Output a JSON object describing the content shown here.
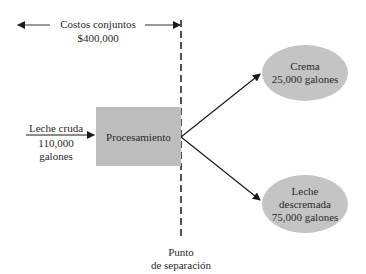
{
  "joint_costs": {
    "label": "Costos conjuntos",
    "amount": "$400,000"
  },
  "input": {
    "label": "Leche cruda",
    "quantity": "110,000",
    "unit": "galones"
  },
  "process": {
    "label": "Procesamiento"
  },
  "outputs": [
    {
      "line1": "Crema",
      "line2": "25,000 galones"
    },
    {
      "line1": "Leche",
      "line2": "descremada",
      "line3": "75,000 galones"
    }
  ],
  "split_point": {
    "line1": "Punto",
    "line2": "de separación"
  },
  "colors": {
    "box": "#bdbdbd",
    "ellipse": "#c4c4c4",
    "line": "#1a1a1a"
  }
}
